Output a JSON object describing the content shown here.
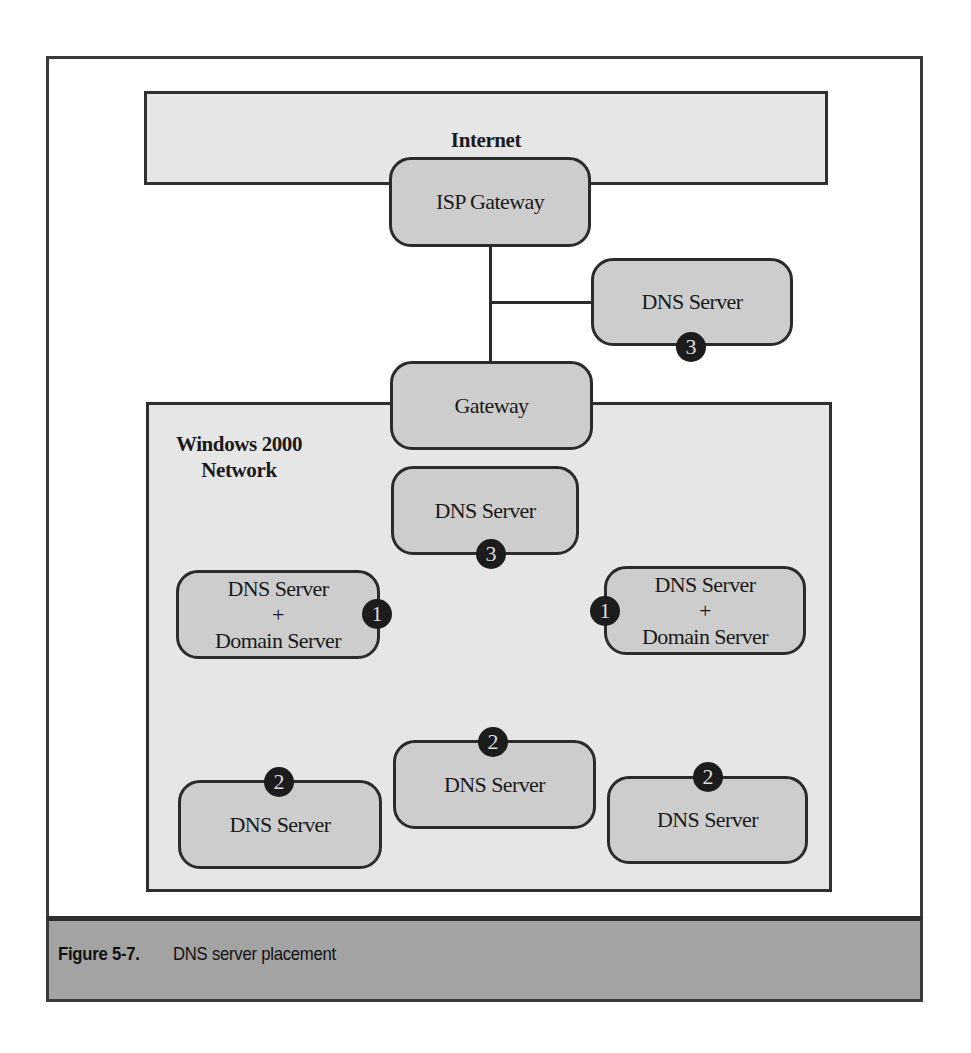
{
  "figure": {
    "number": "Figure 5-7.",
    "title": "DNS server placement"
  },
  "colors": {
    "node_fill": "#cdcdcd",
    "region_fill": "#e6e6e6",
    "border": "#2b2b2b",
    "badge_fill": "#1c1c1c",
    "caption_band": "#a3a3a3"
  },
  "internet": {
    "label": "Internet"
  },
  "isp_gateway": {
    "label": "ISP Gateway"
  },
  "external_dns": {
    "label": "DNS Server",
    "badge": "3"
  },
  "gateway": {
    "label": "Gateway"
  },
  "windows_network": {
    "label_line1": "Windows 2000",
    "label_line2": "Network",
    "nodes": [
      {
        "line1": "DNS Server",
        "badge": "3"
      },
      {
        "line1": "DNS Server",
        "line2": "+",
        "line3": "Domain Server",
        "badge": "1"
      },
      {
        "line1": "DNS Server",
        "line2": "+",
        "line3": "Domain Server",
        "badge": "1"
      },
      {
        "line1": "DNS Server",
        "badge": "2"
      },
      {
        "line1": "DNS Server",
        "badge": "2"
      },
      {
        "line1": "DNS Server",
        "badge": "2"
      }
    ]
  }
}
